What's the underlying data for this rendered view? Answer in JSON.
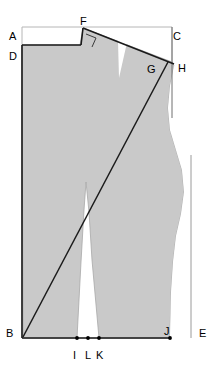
{
  "diagram": {
    "kind": "technical-line-drawing",
    "canvas": {
      "width": 213,
      "height": 384
    },
    "colors": {
      "background": "#ffffff",
      "silhouette_fill": "#c9c9c9",
      "silhouette_stroke": "#9a9a9a",
      "construction_line": "#8f8f8f",
      "main_line": "#111111",
      "label_text": "#000000",
      "point_marker": "#000000"
    },
    "labels": [
      {
        "id": "A",
        "text": "A",
        "x": 9,
        "y": 31,
        "role": "top-left-frame-corner"
      },
      {
        "id": "C",
        "text": "C",
        "x": 173,
        "y": 31,
        "role": "top-right-frame-corner"
      },
      {
        "id": "F",
        "text": "F",
        "x": 80,
        "y": 16,
        "role": "shoulder-dart-apex"
      },
      {
        "id": "D",
        "text": "D",
        "x": 9,
        "y": 51,
        "role": "center-back-neck"
      },
      {
        "id": "H",
        "text": "H",
        "x": 178,
        "y": 63,
        "role": "shoulder-tip"
      },
      {
        "id": "G",
        "text": "G",
        "x": 147,
        "y": 64,
        "role": "shoulder-armhole-junction"
      },
      {
        "id": "B",
        "text": "B",
        "x": 6,
        "y": 328,
        "role": "bottom-left-corner"
      },
      {
        "id": "E",
        "text": "E",
        "x": 199,
        "y": 328,
        "role": "bottom-right-frame-corner"
      },
      {
        "id": "J",
        "text": "J",
        "x": 164,
        "y": 326,
        "role": "hem-point-right"
      },
      {
        "id": "I",
        "text": "I",
        "x": 73,
        "y": 350,
        "role": "hem-point-inner-left"
      },
      {
        "id": "L",
        "text": "L",
        "x": 85,
        "y": 350,
        "role": "hem-point-middle"
      },
      {
        "id": "K",
        "text": "K",
        "x": 96,
        "y": 350,
        "role": "hem-point-inner-right"
      }
    ],
    "points": [
      {
        "id": "I",
        "x": 77,
        "y": 338
      },
      {
        "id": "L",
        "x": 88,
        "y": 338
      },
      {
        "id": "K",
        "x": 99,
        "y": 338
      },
      {
        "id": "J",
        "x": 170,
        "y": 338
      }
    ],
    "frame": {
      "left": 22,
      "top": 27,
      "right": 172,
      "bottom": 338,
      "description": "light construction rectangle A-C-E-B"
    },
    "annotations": {
      "right_angle_marker_at": "F",
      "diagonal_line": "B to G",
      "shoulder_line": "F to H",
      "vertical_line_from": "C",
      "hem_line": "B to J"
    }
  }
}
